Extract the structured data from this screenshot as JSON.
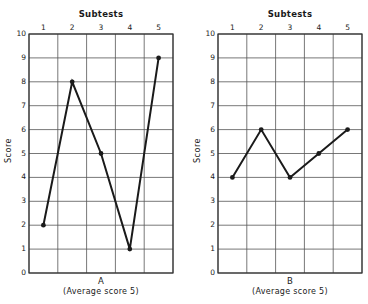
{
  "chart_data": [
    {
      "type": "line",
      "title": "Subtests",
      "panel_label": "A",
      "caption": "(Average score 5)",
      "xlabel": "Subtests",
      "ylabel": "Score",
      "categories": [
        "1",
        "2",
        "3",
        "4",
        "5"
      ],
      "values": [
        2,
        8,
        5,
        1,
        9
      ],
      "ylim": [
        0,
        10
      ],
      "yticks": [
        0,
        1,
        2,
        3,
        4,
        5,
        6,
        7,
        8,
        9,
        10
      ],
      "grid": true,
      "x_axis_position": "top"
    },
    {
      "type": "line",
      "title": "Subtests",
      "panel_label": "B",
      "caption": "(Average score 5)",
      "xlabel": "Subtests",
      "ylabel": "Score",
      "categories": [
        "1",
        "2",
        "3",
        "4",
        "5"
      ],
      "values": [
        4,
        6,
        4,
        5,
        6
      ],
      "ylim": [
        0,
        10
      ],
      "yticks": [
        0,
        1,
        2,
        3,
        4,
        5,
        6,
        7,
        8,
        9,
        10
      ],
      "grid": true,
      "x_axis_position": "top"
    }
  ],
  "colors": {
    "line": "#1a1a1a",
    "grid": "#555555",
    "background": "#ffffff"
  }
}
